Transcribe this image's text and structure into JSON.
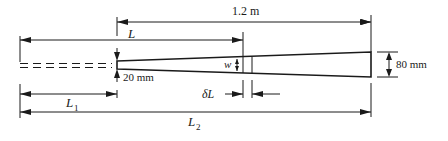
{
  "diagram": {
    "type": "tapered-beam-dimension-drawing",
    "colors": {
      "line": "#1a1a1a",
      "background": "#ffffff"
    },
    "labels": {
      "total_length": "1.2 m",
      "L": "L",
      "L1": "L",
      "L1_sub": "1",
      "L2": "L",
      "L2_sub": "2",
      "narrow_width": "20 mm",
      "wide_width": "80 mm",
      "w": "w",
      "delta_L": "δL"
    }
  }
}
